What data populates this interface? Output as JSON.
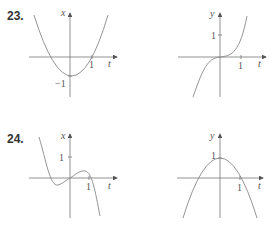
{
  "problems": [
    {
      "number": "23.",
      "graphs": [
        {
          "vertical_label": "x",
          "horizontal_label": "t",
          "ticks": {
            "t": "1",
            "vertical": "−1"
          },
          "curve": "upward parabola, vertex near (0.1,-1), roots near t=-0.9 and t=1"
        },
        {
          "vertical_label": "y",
          "horizontal_label": "t",
          "ticks": {
            "t": "1",
            "vertical": "1"
          },
          "curve": "cubic-like, flat through origin, increasing"
        }
      ]
    },
    {
      "number": "24.",
      "graphs": [
        {
          "vertical_label": "x",
          "horizontal_label": "t",
          "ticks": {
            "t": "1",
            "vertical": "1"
          },
          "curve": "cubic, local min left of origin, local max near t=0.5, decreasing after t=1"
        },
        {
          "vertical_label": "y",
          "horizontal_label": "t",
          "ticks": {
            "t": "1",
            "vertical": "1"
          },
          "curve": "downward parabola, max at (0,1), roots near t=-1 and t=1"
        }
      ]
    }
  ]
}
